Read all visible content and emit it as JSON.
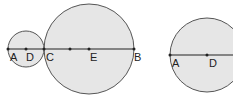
{
  "figures": [
    {
      "name": "two-tangent-circles",
      "small_circle": {
        "cx": 26,
        "cy": 49,
        "r": 18
      },
      "big_circle": {
        "cx": 89,
        "cy": 49,
        "r": 45
      },
      "line": {
        "x1": 8,
        "x2": 134,
        "y": 49
      },
      "points": [
        {
          "label": "A",
          "x": 8
        },
        {
          "label": "D",
          "x": 26
        },
        {
          "label": "C",
          "x": 44
        },
        {
          "label": "",
          "x": 70
        },
        {
          "label": "E",
          "x": 89
        },
        {
          "label": "B",
          "x": 134
        }
      ]
    },
    {
      "name": "single-circle",
      "circle": {
        "cx": 207,
        "cy": 55,
        "r": 37
      },
      "line": {
        "x1": 170,
        "x2": 233,
        "y": 55
      },
      "points": [
        {
          "label": "A",
          "x": 170
        },
        {
          "label": "D",
          "x": 207
        }
      ]
    }
  ],
  "colors": {
    "fill": "#e6e6e6",
    "stroke": "#555555",
    "line": "#222222"
  }
}
